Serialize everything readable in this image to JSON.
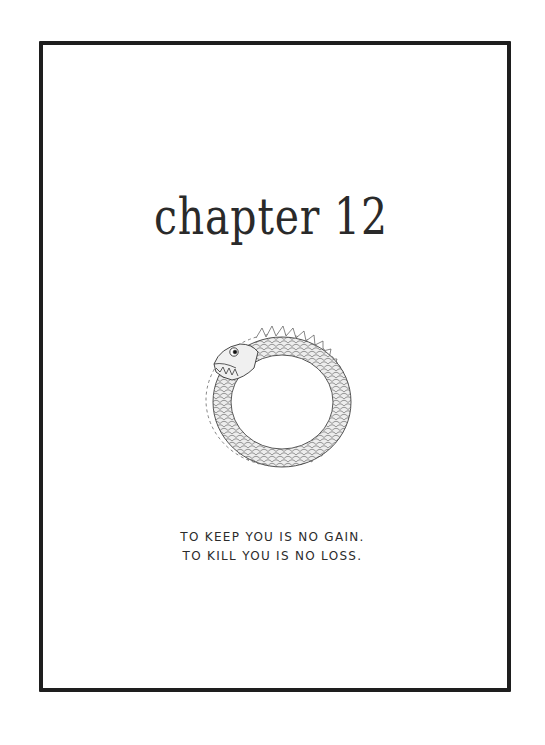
{
  "page": {
    "title": "chapter 12",
    "illustration": "ouroboros-snake-icon",
    "epigraph": [
      "TO KEEP YOU IS NO GAIN.",
      "TO KILL YOU IS NO LOSS."
    ]
  },
  "colors": {
    "ink": "#1e1e1e",
    "paper": "#ffffff",
    "scale_shade": "#e6e6e6"
  }
}
